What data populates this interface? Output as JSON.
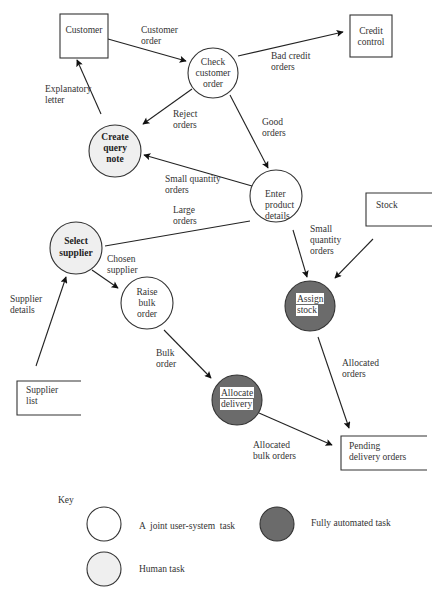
{
  "diagram": {
    "external_entities": [
      {
        "id": "customer",
        "label": [
          "Customer"
        ]
      },
      {
        "id": "credit_control",
        "label": [
          "Credit",
          "control"
        ]
      },
      {
        "id": "stock",
        "label": [
          "Stock"
        ]
      },
      {
        "id": "supplier_list",
        "label": [
          "Supplier",
          "list"
        ]
      },
      {
        "id": "pending_delivery_orders",
        "label": [
          "Pending",
          "delivery orders"
        ]
      }
    ],
    "processes": [
      {
        "id": "check_customer_order",
        "label": [
          "Check",
          "customer",
          "order"
        ],
        "type": "joint"
      },
      {
        "id": "create_query_note",
        "label": [
          "Create",
          "query",
          "note"
        ],
        "type": "human"
      },
      {
        "id": "enter_product_details",
        "label": [
          "Enter",
          "product",
          "details"
        ],
        "type": "joint"
      },
      {
        "id": "select_supplier",
        "label": [
          "Select",
          "supplier"
        ],
        "type": "human"
      },
      {
        "id": "raise_bulk_order",
        "label": [
          "Raise",
          "bulk",
          "order"
        ],
        "type": "joint"
      },
      {
        "id": "assign_stock",
        "label": [
          "Assign",
          "stock"
        ],
        "type": "automated"
      },
      {
        "id": "allocate_delivery",
        "label": [
          "Allocate",
          "delivery"
        ],
        "type": "automated"
      }
    ],
    "flows": [
      {
        "from": "customer",
        "to": "check_customer_order",
        "label": [
          "Customer",
          "order"
        ]
      },
      {
        "from": "check_customer_order",
        "to": "credit_control",
        "label": [
          "Bad credit",
          "orders"
        ]
      },
      {
        "from": "check_customer_order",
        "to": "create_query_note",
        "label": [
          "Reject",
          "orders"
        ]
      },
      {
        "from": "create_query_note",
        "to": "customer",
        "label": [
          "Explanatory",
          "letter"
        ]
      },
      {
        "from": "check_customer_order",
        "to": "enter_product_details",
        "label": [
          "Good",
          "orders"
        ]
      },
      {
        "from": "enter_product_details",
        "to": "create_query_note",
        "label": [
          "Small quantity",
          "orders"
        ]
      },
      {
        "from": "enter_product_details",
        "to": "select_supplier",
        "label": [
          "Large",
          "orders"
        ]
      },
      {
        "from": "enter_product_details",
        "to": "assign_stock",
        "label": [
          "Small",
          "quantity",
          "orders"
        ]
      },
      {
        "from": "stock",
        "to": "assign_stock",
        "label": []
      },
      {
        "from": "select_supplier",
        "to": "raise_bulk_order",
        "label": [
          "Chosen",
          "supplier"
        ]
      },
      {
        "from": "supplier_list",
        "to": "select_supplier",
        "label": [
          "Supplier",
          "details"
        ]
      },
      {
        "from": "raise_bulk_order",
        "to": "allocate_delivery",
        "label": [
          "Bulk",
          "order"
        ]
      },
      {
        "from": "assign_stock",
        "to": "pending_delivery_orders",
        "label": [
          "Allocated",
          "orders"
        ]
      },
      {
        "from": "allocate_delivery",
        "to": "pending_delivery_orders",
        "label": [
          "Allocated",
          "bulk orders"
        ]
      }
    ]
  },
  "key": {
    "title": "Key",
    "items": [
      {
        "type": "joint",
        "label": "A  joint user-system  task"
      },
      {
        "type": "automated",
        "label": "Fully automated task"
      },
      {
        "type": "human",
        "label": "Human task"
      }
    ]
  },
  "colors": {
    "joint_fill": "#ffffff",
    "human_fill": "#efefef",
    "automated_fill": "#6b6b6b",
    "stroke": "#333333"
  }
}
